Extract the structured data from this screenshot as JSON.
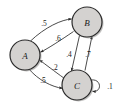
{
  "diagram": {
    "type": "state-transition-diagram",
    "title": "",
    "nodes": [
      {
        "id": "A",
        "label": "A",
        "cx": 25,
        "cy": 55,
        "r": 15
      },
      {
        "id": "B",
        "label": "B",
        "cx": 87,
        "cy": 22,
        "r": 15
      },
      {
        "id": "C",
        "label": "C",
        "cx": 77,
        "cy": 85,
        "r": 15
      }
    ],
    "edges": [
      {
        "id": "A-to-B",
        "from": "A",
        "to": "B",
        "label": ".5"
      },
      {
        "id": "B-to-A",
        "from": "B",
        "to": "A",
        "label": ".6"
      },
      {
        "id": "C-to-A",
        "from": "C",
        "to": "A",
        "label": ".2"
      },
      {
        "id": "A-to-C",
        "from": "A",
        "to": "C",
        "label": ".5"
      },
      {
        "id": "B-to-C",
        "from": "B",
        "to": "C",
        "label": ".4"
      },
      {
        "id": "C-to-B",
        "from": "C",
        "to": "B",
        "label": ".7"
      },
      {
        "id": "C-to-C",
        "from": "C",
        "to": "C",
        "label": ".1"
      }
    ],
    "colors": {
      "node_fill": "#d4d2d0",
      "node_stroke": "#2b2b2b",
      "edge_stroke": "#2b2b2b",
      "background": "#ffffff",
      "shadow": "#8e8c8a"
    }
  }
}
